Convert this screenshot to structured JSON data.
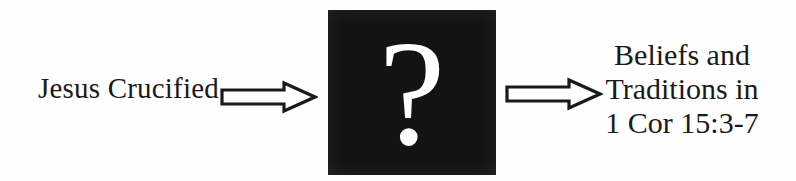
{
  "diagram": {
    "type": "flow-diagram",
    "background_color": "#fefefe",
    "input_label": "Jesus Crucified",
    "process_box": {
      "symbol": "?",
      "box_color": "#131313",
      "symbol_color": "#ffffff"
    },
    "output_label": "Beliefs and\nTraditions in\n1 Cor 15:3-7",
    "arrows": {
      "count": 2,
      "direction": "right",
      "style": "hollow-block",
      "fill": "#ffffff",
      "outline": "#1a1a1a"
    }
  }
}
